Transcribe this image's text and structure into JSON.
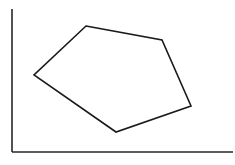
{
  "figure": {
    "background_color": "#ffffff",
    "width": 235,
    "height": 165
  },
  "axes": {
    "name": "coordinate-axes",
    "stroke_color": "#262626",
    "stroke_width": 1.6,
    "origin": {
      "x": 12,
      "y": 152
    },
    "y_axis": {
      "x": 12,
      "y_top": 9,
      "y_bottom": 152
    },
    "x_axis": {
      "y": 152,
      "x_left": 12,
      "x_right": 233
    },
    "ticks": [],
    "tick_labels": [],
    "x_label": "",
    "y_label": ""
  },
  "shape": {
    "name": "pentagon",
    "type": "polygon",
    "sides": 5,
    "stroke_color": "#1a1a1a",
    "fill_color": "none",
    "stroke_width": 1.6,
    "closed": true,
    "vertices": [
      {
        "label": "top",
        "x": 86,
        "y": 26
      },
      {
        "label": "upper-right",
        "x": 162,
        "y": 40
      },
      {
        "label": "right",
        "x": 191,
        "y": 106
      },
      {
        "label": "bottom",
        "x": 116,
        "y": 132
      },
      {
        "label": "left",
        "x": 34,
        "y": 75
      }
    ],
    "points_attr": "86,26 162,40 191,106 116,132 34,75"
  }
}
